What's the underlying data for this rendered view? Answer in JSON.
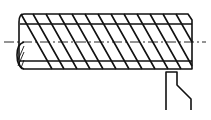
{
  "diagram": {
    "title": "",
    "colors": {
      "line": "#111111",
      "background": "#ffffff"
    },
    "parts": [
      {
        "name": "workpiece",
        "kind": "cylinder-with-helical-thread"
      },
      {
        "name": "centerline",
        "kind": "dash-dot axis"
      },
      {
        "name": "section-hatch",
        "kind": "hatched end section"
      },
      {
        "name": "cutting-tool",
        "kind": "threading tool"
      }
    ],
    "labels": []
  }
}
